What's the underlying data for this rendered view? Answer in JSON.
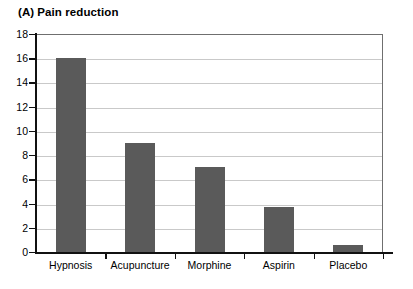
{
  "chart_data": {
    "type": "bar",
    "panel_tag": "(A)",
    "title_text": "Pain reduction",
    "categories": [
      "Hypnosis",
      "Acupuncture",
      "Morphine",
      "Aspirin",
      "Placebo"
    ],
    "values": [
      16,
      9,
      7,
      3.7,
      0.6
    ],
    "xlabel": "",
    "ylabel": "",
    "ylim": [
      0,
      18
    ],
    "ytick_step": 2,
    "yticks": [
      0,
      2,
      4,
      6,
      8,
      10,
      12,
      14,
      16,
      18
    ],
    "ytick_labels": [
      "0",
      "2",
      "4",
      "6",
      "8",
      "10",
      "12",
      "14",
      "16",
      "18"
    ],
    "grid": true,
    "grid_axis": "y",
    "legend": false,
    "bar_color": "#5a5a5a",
    "grid_color": "#c9c9c9",
    "axis_color": "#111111",
    "background_color": "#ffffff"
  }
}
